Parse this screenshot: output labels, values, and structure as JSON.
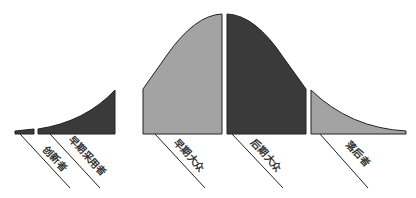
{
  "diagram": {
    "title": "",
    "segments": [
      {
        "id": "innovators",
        "label": "创新者",
        "fill": "#3a3a3a"
      },
      {
        "id": "early-adopters",
        "label": "早期采用者",
        "fill": "#3a3a3a"
      },
      {
        "id": "early-majority",
        "label": "早期大众",
        "fill": "#a3a3a3"
      },
      {
        "id": "late-majority",
        "label": "后期大众",
        "fill": "#3a3a3a"
      },
      {
        "id": "laggards",
        "label": "落后者",
        "fill": "#a3a3a3"
      }
    ],
    "stroke_color": "#222222"
  }
}
